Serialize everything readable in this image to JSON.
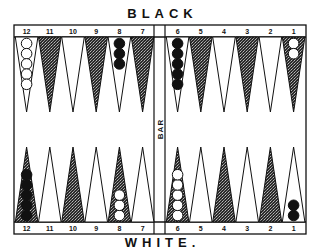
{
  "labels": {
    "top_player": "BLACK",
    "bottom_player": "WHITE.",
    "bar": "BAR"
  },
  "colors": {
    "ink": "#111111",
    "paper": "#ffffff",
    "stipple": "#3a3a3a"
  },
  "top_row": [
    {
      "number": "12",
      "shade": "light",
      "checkers": {
        "color": "white",
        "count": 5
      }
    },
    {
      "number": "11",
      "shade": "dark",
      "checkers": {
        "color": "none",
        "count": 0
      }
    },
    {
      "number": "10",
      "shade": "light",
      "checkers": {
        "color": "none",
        "count": 0
      }
    },
    {
      "number": "9",
      "shade": "dark",
      "checkers": {
        "color": "none",
        "count": 0
      }
    },
    {
      "number": "8",
      "shade": "light",
      "checkers": {
        "color": "black",
        "count": 3
      }
    },
    {
      "number": "7",
      "shade": "dark",
      "checkers": {
        "color": "none",
        "count": 0
      }
    },
    {
      "number": "6",
      "shade": "light",
      "checkers": {
        "color": "black",
        "count": 5
      }
    },
    {
      "number": "5",
      "shade": "dark",
      "checkers": {
        "color": "none",
        "count": 0
      }
    },
    {
      "number": "4",
      "shade": "light",
      "checkers": {
        "color": "none",
        "count": 0
      }
    },
    {
      "number": "3",
      "shade": "dark",
      "checkers": {
        "color": "none",
        "count": 0
      }
    },
    {
      "number": "2",
      "shade": "light",
      "checkers": {
        "color": "none",
        "count": 0
      }
    },
    {
      "number": "1",
      "shade": "dark",
      "checkers": {
        "color": "white",
        "count": 2
      }
    }
  ],
  "bottom_row": [
    {
      "number": "12",
      "shade": "dark",
      "checkers": {
        "color": "black",
        "count": 5
      }
    },
    {
      "number": "11",
      "shade": "light",
      "checkers": {
        "color": "none",
        "count": 0
      }
    },
    {
      "number": "10",
      "shade": "dark",
      "checkers": {
        "color": "none",
        "count": 0
      }
    },
    {
      "number": "9",
      "shade": "light",
      "checkers": {
        "color": "none",
        "count": 0
      }
    },
    {
      "number": "8",
      "shade": "dark",
      "checkers": {
        "color": "white",
        "count": 3
      }
    },
    {
      "number": "7",
      "shade": "light",
      "checkers": {
        "color": "none",
        "count": 0
      }
    },
    {
      "number": "6",
      "shade": "dark",
      "checkers": {
        "color": "white",
        "count": 5
      }
    },
    {
      "number": "5",
      "shade": "light",
      "checkers": {
        "color": "none",
        "count": 0
      }
    },
    {
      "number": "4",
      "shade": "dark",
      "checkers": {
        "color": "none",
        "count": 0
      }
    },
    {
      "number": "3",
      "shade": "light",
      "checkers": {
        "color": "none",
        "count": 0
      }
    },
    {
      "number": "2",
      "shade": "dark",
      "checkers": {
        "color": "none",
        "count": 0
      }
    },
    {
      "number": "1",
      "shade": "light",
      "checkers": {
        "color": "black",
        "count": 2
      }
    }
  ]
}
